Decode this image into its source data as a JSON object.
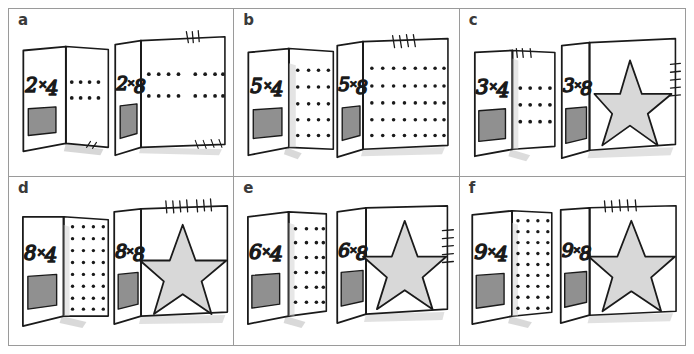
{
  "page": {
    "background_color": "#ffffff",
    "border_color": "#9a9a9a",
    "ink_color": "#1a1a1a",
    "card_fill": "#ffffff",
    "window_fill": "#909090",
    "star_fill": "#d8d8d8",
    "shadow_color": "#c9c9c9",
    "rows": 2,
    "columns": 3
  },
  "panels": [
    {
      "id": "a",
      "label": "a",
      "left_card": {
        "expression": "2×4",
        "factor_a": 2,
        "factor_b": 4,
        "content": "dot-array",
        "dot_rows": 2,
        "dot_cols": 4,
        "has_window": true
      },
      "right_card": {
        "expression": "2×8",
        "factor_a": 2,
        "factor_b": 8,
        "content": "dot-array",
        "dot_rows": 2,
        "dot_cols": 8,
        "has_window": true
      },
      "tally_top": 3,
      "tally_bottom": 4
    },
    {
      "id": "b",
      "label": "b",
      "left_card": {
        "expression": "5×4",
        "factor_a": 5,
        "factor_b": 4,
        "content": "dot-array",
        "dot_rows": 5,
        "dot_cols": 4,
        "has_window": true
      },
      "right_card": {
        "expression": "5×8",
        "factor_a": 5,
        "factor_b": 8,
        "content": "dot-array",
        "dot_rows": 5,
        "dot_cols": 8,
        "has_window": true
      },
      "tally_top": 4,
      "tally_bottom": 0
    },
    {
      "id": "c",
      "label": "c",
      "left_card": {
        "expression": "3×4",
        "factor_a": 3,
        "factor_b": 4,
        "content": "dot-array",
        "dot_rows": 3,
        "dot_cols": 4,
        "has_window": true
      },
      "right_card": {
        "expression": "3×8",
        "factor_a": 3,
        "factor_b": 8,
        "content": "star",
        "has_window": true
      },
      "tally_top": 3,
      "tally_right": 5
    },
    {
      "id": "d",
      "label": "d",
      "left_card": {
        "expression": "8×4",
        "factor_a": 8,
        "factor_b": 4,
        "content": "dot-array",
        "dot_rows": 8,
        "dot_cols": 4,
        "has_window": true
      },
      "right_card": {
        "expression": "8×8",
        "factor_a": 8,
        "factor_b": 8,
        "content": "star",
        "has_window": true
      },
      "tally_top": 7,
      "tally_bottom": 0
    },
    {
      "id": "e",
      "label": "e",
      "left_card": {
        "expression": "6×4",
        "factor_a": 6,
        "factor_b": 4,
        "content": "dot-array",
        "dot_rows": 6,
        "dot_cols": 4,
        "has_window": true
      },
      "right_card": {
        "expression": "6×8",
        "factor_a": 6,
        "factor_b": 8,
        "content": "star",
        "has_window": true
      },
      "tally_top": 0,
      "tally_right": 5
    },
    {
      "id": "f",
      "label": "f",
      "left_card": {
        "expression": "9×4",
        "factor_a": 9,
        "factor_b": 4,
        "content": "dot-array",
        "dot_rows": 9,
        "dot_cols": 4,
        "has_window": true
      },
      "right_card": {
        "expression": "9×8",
        "factor_a": 9,
        "factor_b": 8,
        "content": "star",
        "has_window": true
      },
      "tally_top": 5,
      "tally_bottom": 0
    }
  ]
}
